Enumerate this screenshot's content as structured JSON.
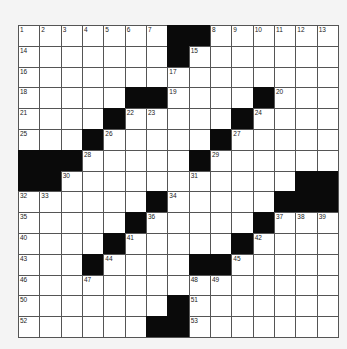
{
  "puzzle": {
    "rows": 15,
    "cols": 15,
    "black_cells": [
      [
        0,
        7
      ],
      [
        0,
        8
      ],
      [
        1,
        7
      ],
      [
        3,
        5
      ],
      [
        3,
        6
      ],
      [
        3,
        11
      ],
      [
        4,
        4
      ],
      [
        4,
        10
      ],
      [
        5,
        3
      ],
      [
        5,
        9
      ],
      [
        6,
        0
      ],
      [
        6,
        1
      ],
      [
        6,
        2
      ],
      [
        6,
        8
      ],
      [
        7,
        0
      ],
      [
        7,
        1
      ],
      [
        7,
        13
      ],
      [
        7,
        14
      ],
      [
        8,
        6
      ],
      [
        8,
        12
      ],
      [
        8,
        13
      ],
      [
        8,
        14
      ],
      [
        9,
        5
      ],
      [
        9,
        11
      ],
      [
        10,
        4
      ],
      [
        10,
        10
      ],
      [
        11,
        3
      ],
      [
        11,
        8
      ],
      [
        11,
        9
      ],
      [
        13,
        7
      ],
      [
        14,
        6
      ],
      [
        14,
        7
      ]
    ],
    "numbers": {
      "0,0": "1",
      "0,1": "2",
      "0,2": "3",
      "0,3": "4",
      "0,4": "5",
      "0,5": "6",
      "0,6": "7",
      "0,9": "8",
      "0,10": "9",
      "0,11": "10",
      "0,12": "11",
      "0,13": "12",
      "0,14": "13",
      "1,0": "14",
      "1,8": "15",
      "2,0": "16",
      "2,7": "17",
      "3,0": "18",
      "3,7": "19",
      "3,12": "20",
      "4,0": "21",
      "4,5": "22",
      "4,6": "23",
      "4,11": "24",
      "5,0": "25",
      "5,4": "26",
      "5,10": "27",
      "6,3": "28",
      "6,9": "29",
      "7,2": "30",
      "7,8": "31",
      "8,0": "32",
      "8,1": "33",
      "8,7": "34",
      "9,0": "35",
      "9,6": "36",
      "9,12": "37",
      "9,13": "38",
      "9,14": "39",
      "10,0": "40",
      "10,5": "41",
      "10,11": "42",
      "11,0": "43",
      "11,4": "44",
      "11,10": "45",
      "12,0": "46",
      "12,3": "47",
      "12,8": "48",
      "12,9": "49",
      "13,0": "50",
      "13,8": "51",
      "14,0": "52",
      "14,8": "53"
    },
    "colors": {
      "block": "#0a0a0a",
      "cell": "#ffffff",
      "grid_line": "#555555",
      "background": "#f4f4f4"
    }
  }
}
